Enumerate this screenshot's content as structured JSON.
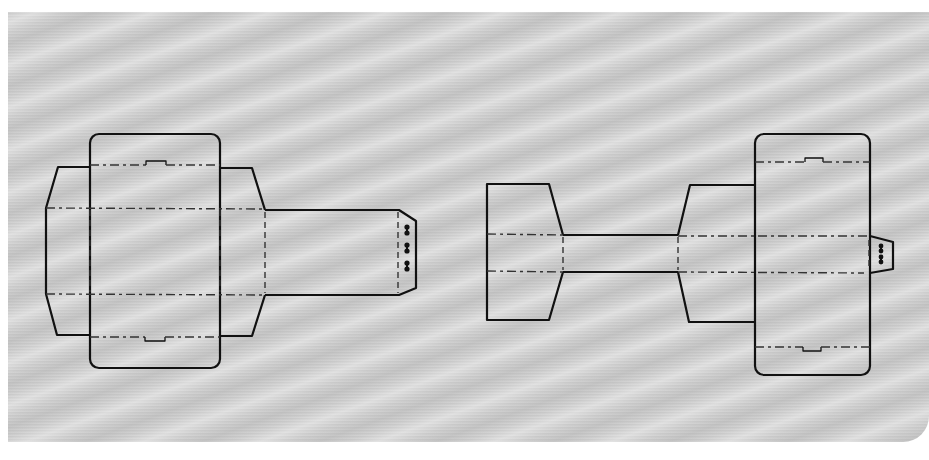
{
  "figure": {
    "colors": {
      "background_panel": "#cfcfcf",
      "cut_line": "#111111",
      "fold_line": "#333333"
    },
    "line_types": {
      "cut": "solid",
      "fold": "dash-dot"
    },
    "nets": [
      {
        "id": "left-net",
        "parts": [
          "main-panel-rounded",
          "left-side-flap",
          "right-side-flap",
          "glue-tab-strip",
          "locking-tab-with-3-slots"
        ],
        "slot_count": 3
      },
      {
        "id": "right-net",
        "parts": [
          "end-panel",
          "connecting-strip",
          "trapezoid-flap",
          "main-panel-rounded",
          "locking-tab-with-2-slots"
        ],
        "slot_count": 2
      }
    ]
  }
}
